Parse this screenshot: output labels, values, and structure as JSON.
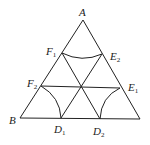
{
  "diagram": {
    "type": "geometry",
    "colors": {
      "stroke": "#222222",
      "background": "#ffffff"
    },
    "points": {
      "A": {
        "label": "A",
        "sub": "",
        "x": 83,
        "y": 20
      },
      "B": {
        "label": "B",
        "sub": "",
        "x": 20,
        "y": 118
      },
      "C": {
        "label": "",
        "sub": "",
        "x": 140,
        "y": 119
      },
      "F1": {
        "label": "F",
        "sub": "1",
        "x": 62,
        "y": 53
      },
      "E2": {
        "label": "E",
        "sub": "2",
        "x": 102,
        "y": 54
      },
      "F2": {
        "label": "F",
        "sub": "2",
        "x": 41,
        "y": 86
      },
      "E1": {
        "label": "E",
        "sub": "1",
        "x": 120,
        "y": 88
      },
      "D1": {
        "label": "D",
        "sub": "1",
        "x": 61,
        "y": 118
      },
      "D2": {
        "label": "D",
        "sub": "2",
        "x": 100,
        "y": 119
      }
    },
    "labels": {
      "A": "A",
      "B": "B",
      "F1_main": "F",
      "F1_sub": "1",
      "E2_main": "E",
      "E2_sub": "2",
      "F2_main": "F",
      "F2_sub": "2",
      "E1_main": "E",
      "E1_sub": "1",
      "D1_main": "D",
      "D1_sub": "1",
      "D2_main": "D",
      "D2_sub": "2"
    },
    "segments": [
      [
        "A",
        "B"
      ],
      [
        "A",
        "C"
      ],
      [
        "B",
        "C"
      ],
      [
        "F2",
        "E1"
      ],
      [
        "F1",
        "D2"
      ],
      [
        "E2",
        "D1"
      ]
    ],
    "arcs": [
      {
        "from": "F1",
        "to": "E2",
        "center": "A"
      },
      {
        "from": "F2",
        "to": "D1",
        "center": "B"
      },
      {
        "from": "E1",
        "to": "D2",
        "center": "C"
      }
    ]
  }
}
